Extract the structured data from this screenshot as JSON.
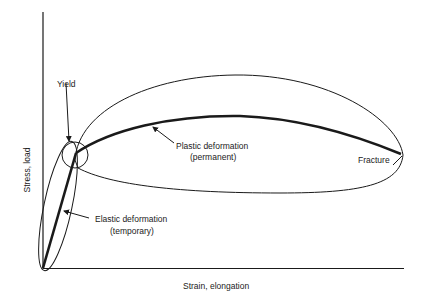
{
  "diagram": {
    "axes": {
      "y_label": "Stress, load",
      "x_label": "Strain, elongation"
    },
    "annotations": {
      "yield": "Yield",
      "plastic_line1": "Plastic deformation",
      "plastic_line2": "(permanent)",
      "elastic_line1": "Elastic deformation",
      "elastic_line2": "(temporary)",
      "fracture": "Fracture"
    },
    "colors": {
      "stroke": "#1a1a1a",
      "text": "#222222",
      "background": "#ffffff"
    }
  }
}
